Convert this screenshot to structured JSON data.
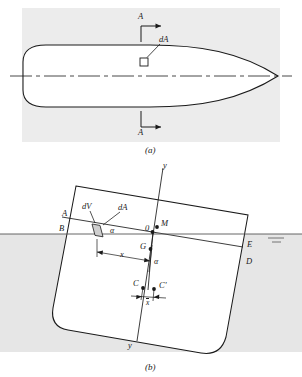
{
  "figure": {
    "panels": [
      {
        "id": "a",
        "caption": "(a)",
        "description": "Plan view of waterplane area with section line A-A and elemental area dA",
        "labels": {
          "section_top": "A",
          "section_bottom": "A",
          "element_area": "dA"
        },
        "icons": [
          "section-arrow-icon",
          "centerline-icon",
          "element-square-icon"
        ]
      },
      {
        "id": "b",
        "caption": "(b)",
        "description": "Heeled ship cross-section showing metacentre M, centre of gravity G, centre of buoyancy C and shifted centre C-prime",
        "labels": {
          "axis_top": "y",
          "axis_bottom": "y",
          "origin": "0",
          "metacentre": "M",
          "gravity_centre": "G",
          "buoyancy_centre": "C",
          "buoyancy_centre_shifted": "C'",
          "waterline_left_upper": "A",
          "waterline_left_lower": "B",
          "waterline_right_upper": "E",
          "waterline_right_lower": "D",
          "element_volume": "dV",
          "element_area": "dA",
          "heel_angle_water": "α",
          "heel_angle_axis": "α",
          "lever_arm": "x",
          "shift_distance": "x"
        },
        "icons": [
          "water-surface-icon",
          "hatch-marks-icon",
          "dimension-arrow-icon"
        ]
      }
    ],
    "colors": {
      "line": "#1a1a1a",
      "panel_tint": "#ececec",
      "water_tint": "#e6e6e6",
      "strip_fill": "#cfcfcf",
      "hull_fill": "#ffffff"
    }
  }
}
